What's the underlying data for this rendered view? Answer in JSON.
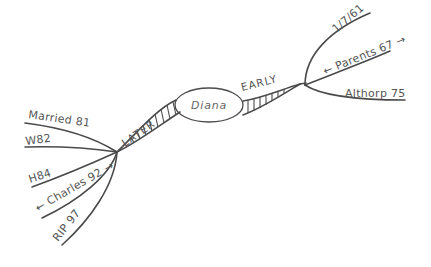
{
  "center": {
    "label": "Diana"
  },
  "branches": {
    "early": {
      "label": "EARLY",
      "children": [
        {
          "label": "1/7/61"
        },
        {
          "label": "← Parents 67 →"
        },
        {
          "label": "Althorp 75"
        }
      ]
    },
    "later": {
      "label": "LATER",
      "children": [
        {
          "label": "Married 81"
        },
        {
          "label": "W82"
        },
        {
          "label": "H84"
        },
        {
          "label": "← Charles 92 →"
        },
        {
          "label": "RIP 97"
        }
      ]
    }
  },
  "colors": {
    "ink": "#4a4a4a",
    "text": "#555555",
    "background": "#ffffff"
  }
}
